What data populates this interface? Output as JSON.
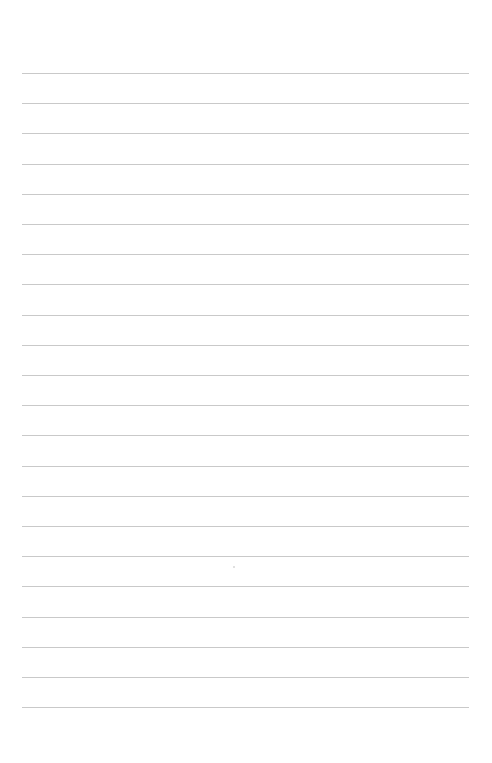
{
  "page": {
    "type": "lined-paper",
    "background_color": "#ffffff",
    "rule_color": "#c9c9c9",
    "rule_count": 22,
    "rule_first_y": 73,
    "rule_spacing": 30.2,
    "rule_left": 22,
    "rule_right": 469,
    "text": ""
  }
}
